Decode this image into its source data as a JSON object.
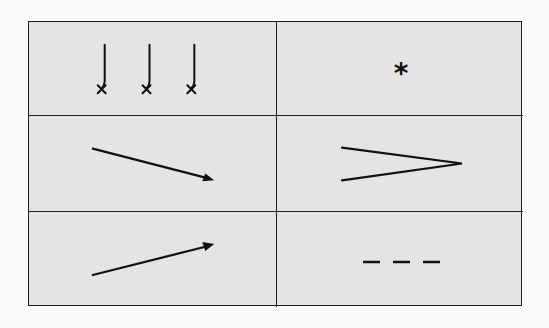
{
  "diagram": {
    "type": "symbol-legend-grid",
    "rows": 3,
    "columns": 2,
    "colors": {
      "page_background": "#fafafa",
      "cell_background": "#e4e4e4",
      "line": "#1c1c1c",
      "symbol": "#111111"
    },
    "cells": [
      {
        "row": 1,
        "col": 1,
        "symbol": "three-hooks-with-x-marks",
        "description": "Three vertical strokes each curving left into an x mark",
        "count": 3
      },
      {
        "row": 1,
        "col": 2,
        "symbol": "asterisk",
        "glyph": "*"
      },
      {
        "row": 2,
        "col": 1,
        "symbol": "arrow-down-right",
        "description": "Diagonal arrow pointing down and to the right"
      },
      {
        "row": 2,
        "col": 2,
        "symbol": "greater-than-wedge",
        "description": "Open wedge converging to a point on the right"
      },
      {
        "row": 3,
        "col": 1,
        "symbol": "arrow-up-right",
        "description": "Diagonal arrow pointing up and to the right"
      },
      {
        "row": 3,
        "col": 2,
        "symbol": "dashed-line",
        "description": "Three short horizontal dashes",
        "count": 3
      }
    ]
  }
}
